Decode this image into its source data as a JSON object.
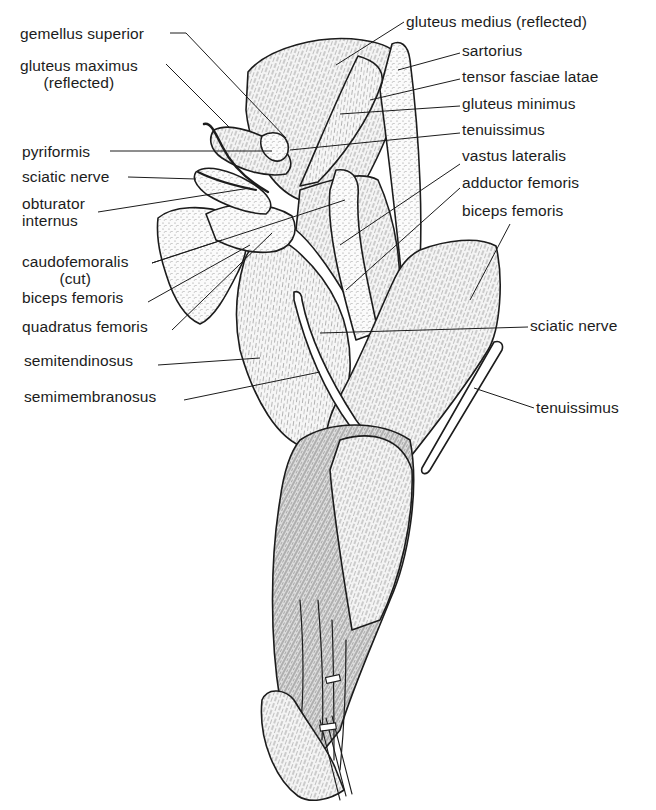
{
  "figure": {
    "colors": {
      "ink": "#1c1c1c",
      "background": "#ffffff",
      "shade": "#7a7a7a"
    }
  },
  "labels_left": [
    {
      "id": "gemellus-superior",
      "lines": [
        "gemellus superior"
      ],
      "x": 20,
      "y": 25,
      "align": "left",
      "leader": [
        [
          170,
          33
        ],
        [
          186,
          33
        ],
        [
          286,
          138
        ]
      ]
    },
    {
      "id": "gluteus-maximus-reflected",
      "lines": [
        "gluteus maximus",
        "(reflected)"
      ],
      "x": 20,
      "y": 57,
      "align": "center",
      "leader": [
        [
          166,
          64
        ],
        [
          230,
          128
        ]
      ]
    },
    {
      "id": "pyriformis",
      "lines": [
        "pyriformis"
      ],
      "x": 22,
      "y": 143,
      "align": "left",
      "leader": [
        [
          110,
          151
        ],
        [
          272,
          151
        ]
      ]
    },
    {
      "id": "sciatic-nerve-left",
      "lines": [
        "sciatic nerve"
      ],
      "x": 22,
      "y": 168,
      "align": "left",
      "leader": [
        [
          128,
          177
        ],
        [
          196,
          179
        ]
      ]
    },
    {
      "id": "obturator-internus",
      "lines": [
        "obturator",
        "internus"
      ],
      "x": 22,
      "y": 195,
      "align": "left",
      "leader": [
        [
          98,
          212
        ],
        [
          250,
          188
        ]
      ]
    },
    {
      "id": "caudofemoralis-cut",
      "lines": [
        "caudofemoralis",
        "(cut)"
      ],
      "x": 22,
      "y": 253,
      "align": "center",
      "leader": [
        [
          152,
          263
        ],
        [
          222,
          240
        ]
      ],
      "leader2": [
        [
          152,
          263
        ],
        [
          345,
          200
        ]
      ]
    },
    {
      "id": "biceps-femoris-left",
      "lines": [
        "biceps femoris"
      ],
      "x": 22,
      "y": 289,
      "align": "left",
      "leader": [
        [
          148,
          302
        ],
        [
          250,
          245
        ]
      ]
    },
    {
      "id": "quadratus-femoris",
      "lines": [
        "quadratus femoris"
      ],
      "x": 22,
      "y": 318,
      "align": "left",
      "leader": [
        [
          172,
          330
        ],
        [
          272,
          233
        ]
      ]
    },
    {
      "id": "semitendinosus",
      "lines": [
        "semitendinosus"
      ],
      "x": 24,
      "y": 352,
      "align": "left",
      "leader": [
        [
          158,
          365
        ],
        [
          260,
          358
        ]
      ]
    },
    {
      "id": "semimembranosus",
      "lines": [
        "semimembranosus"
      ],
      "x": 24,
      "y": 388,
      "align": "left",
      "leader": [
        [
          184,
          400
        ],
        [
          320,
          372
        ]
      ]
    }
  ],
  "labels_right": [
    {
      "id": "gluteus-medius-reflected",
      "lines": [
        "gluteus medius (reflected)"
      ],
      "x": 406,
      "y": 13,
      "align": "left",
      "leader": [
        [
          404,
          22
        ],
        [
          336,
          65
        ]
      ]
    },
    {
      "id": "sartorius",
      "lines": [
        "sartorius"
      ],
      "x": 462,
      "y": 42,
      "align": "left",
      "leader": [
        [
          460,
          53
        ],
        [
          398,
          70
        ]
      ]
    },
    {
      "id": "tensor-fasciae-latae",
      "lines": [
        "tensor fasciae latae"
      ],
      "x": 462,
      "y": 68,
      "align": "left",
      "leader": [
        [
          460,
          79
        ],
        [
          370,
          100
        ]
      ]
    },
    {
      "id": "gluteus-minimus",
      "lines": [
        "gluteus minimus"
      ],
      "x": 462,
      "y": 95,
      "align": "left",
      "leader": [
        [
          460,
          106
        ],
        [
          340,
          114
        ]
      ]
    },
    {
      "id": "tenuissimus-top",
      "lines": [
        "tenuissimus"
      ],
      "x": 462,
      "y": 121,
      "align": "left",
      "leader": [
        [
          460,
          133
        ],
        [
          290,
          150
        ]
      ]
    },
    {
      "id": "vastus-lateralis",
      "lines": [
        "vastus lateralis"
      ],
      "x": 462,
      "y": 147,
      "align": "left",
      "leader": [
        [
          460,
          164
        ],
        [
          340,
          245
        ]
      ]
    },
    {
      "id": "adductor-femoris",
      "lines": [
        "adductor femoris"
      ],
      "x": 462,
      "y": 174,
      "align": "left",
      "leader": [
        [
          460,
          188
        ],
        [
          346,
          290
        ]
      ]
    },
    {
      "id": "biceps-femoris-right",
      "lines": [
        "biceps femoris"
      ],
      "x": 462,
      "y": 202,
      "align": "left",
      "leader": [
        [
          510,
          224
        ],
        [
          470,
          300
        ]
      ]
    },
    {
      "id": "sciatic-nerve-right",
      "lines": [
        "sciatic nerve"
      ],
      "x": 530,
      "y": 317,
      "align": "left",
      "leader": [
        [
          528,
          327
        ],
        [
          320,
          333
        ]
      ]
    },
    {
      "id": "tenuissimus-bottom",
      "lines": [
        "tenuissimus"
      ],
      "x": 536,
      "y": 399,
      "align": "left",
      "leader": [
        [
          534,
          408
        ],
        [
          474,
          388
        ]
      ]
    }
  ]
}
